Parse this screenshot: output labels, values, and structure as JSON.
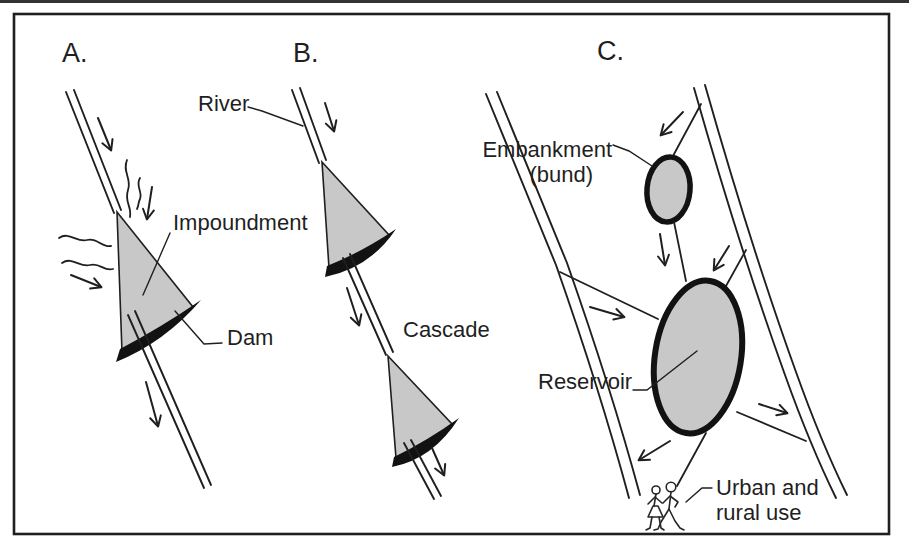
{
  "figure": {
    "colors": {
      "line": "#1f1f1f",
      "water_fill": "#c8c8c8",
      "dam_fill": "#121212",
      "background": "#ffffff"
    },
    "panel_a": {
      "letter": "A.",
      "impoundment_label": "Impoundment",
      "dam_label": "Dam"
    },
    "panel_b": {
      "letter": "B.",
      "river_label": "River",
      "cascade_label": "Cascade"
    },
    "panel_c": {
      "letter": "C.",
      "embankment_label_line1": "Embankment",
      "embankment_label_line2": "(bund)",
      "reservoir_label": "Reservoir",
      "use_label_line1": "Urban and",
      "use_label_line2": "rural use"
    }
  }
}
